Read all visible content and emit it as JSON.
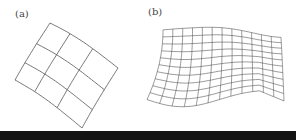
{
  "figure": {
    "panels": [
      {
        "id": "a",
        "label": "(a)",
        "description": "Curved 3x3 grid, rotated",
        "rows": 3,
        "cols": 3
      },
      {
        "id": "b",
        "label": "(b)",
        "description": "Wavy flag-like mesh",
        "rows": 10,
        "cols": 12
      }
    ],
    "colors": {
      "line": "#555555",
      "background": "#ffffff",
      "bar": "#141414"
    }
  }
}
